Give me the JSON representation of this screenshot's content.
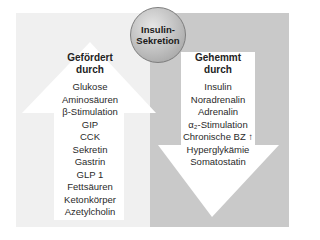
{
  "center": {
    "line1": "Insulin-",
    "line2": "Sekretion"
  },
  "left": {
    "heading_line1": "Gefördert",
    "heading_line2": "durch",
    "items": [
      "Glukose",
      "Aminosäuren",
      "β-Stimulation",
      "GIP",
      "CCK",
      "Sekretin",
      "Gastrin",
      "GLP 1",
      "Fettsäuren",
      "Ketonkörper",
      "Azetylcholin"
    ]
  },
  "right": {
    "heading_line1": "Gehemmt",
    "heading_line2": "durch",
    "items": [
      "Insulin",
      "Noradrenalin",
      "Adrenalin",
      "α₂-Stimulation",
      "Chronische BZ ↑",
      "Hyperglykämie",
      "Somatostatin"
    ]
  },
  "colors": {
    "left_bg": "#f0f0f0",
    "right_bg": "#c9c9c9",
    "arrow": "#ffffff"
  }
}
